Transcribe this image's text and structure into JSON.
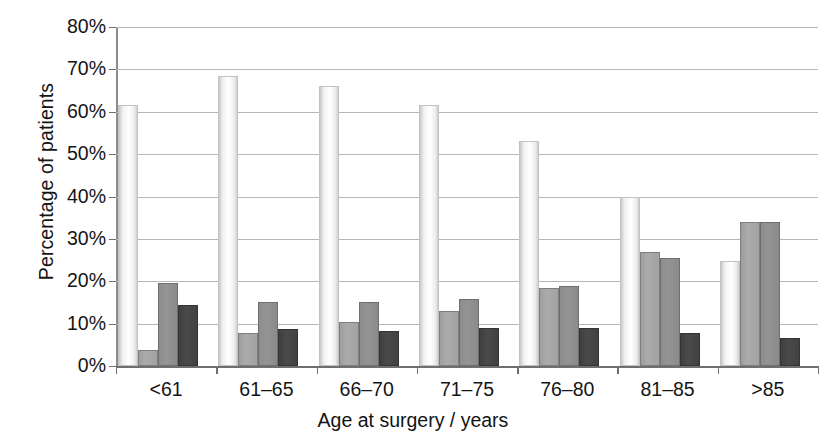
{
  "chart_data": {
    "type": "bar",
    "title": "",
    "xlabel": "Age at surgery / years",
    "ylabel": "Percentage of patients",
    "categories": [
      "<61",
      "61–65",
      "66–70",
      "71–75",
      "76–80",
      "81–85",
      ">85"
    ],
    "ylim": [
      0,
      80
    ],
    "ytick_labels": [
      "0%",
      "10%",
      "20%",
      "30%",
      "40%",
      "50%",
      "60%",
      "70%",
      "80%"
    ],
    "ytick_values": [
      0,
      10,
      20,
      30,
      40,
      50,
      60,
      70,
      80
    ],
    "grid": "horizontal",
    "legend": "none",
    "series": [
      {
        "name": "series-1",
        "color": "#ffffff",
        "values": [
          61.5,
          68.5,
          66.0,
          61.5,
          53.0,
          40.0,
          24.8
        ]
      },
      {
        "name": "series-2",
        "color": "#a5a5a5",
        "values": [
          3.8,
          7.8,
          10.3,
          13.0,
          18.3,
          26.8,
          34.0
        ]
      },
      {
        "name": "series-3",
        "color": "#8d8d8d",
        "values": [
          19.5,
          15.0,
          15.0,
          15.9,
          19.0,
          25.6,
          34.0
        ]
      },
      {
        "name": "series-4",
        "color": "#424242",
        "values": [
          14.5,
          8.7,
          8.3,
          8.9,
          8.9,
          7.9,
          6.5
        ]
      }
    ]
  }
}
